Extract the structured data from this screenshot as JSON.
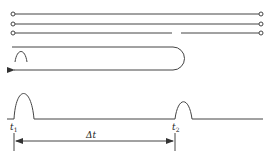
{
  "diagram": {
    "type": "signal-propagation-schematic",
    "colors": {
      "stroke": "#333333",
      "background": "#ffffff"
    },
    "cable": {
      "conductors": 3,
      "third_conductor_gap": true,
      "terminals": "open-circle-ends"
    },
    "reflection_loop": {
      "arrow_direction": "left",
      "pulse_shown": true
    },
    "timing": {
      "label_t1_base": "t",
      "label_t1_sub": "1",
      "label_t2_base": "t",
      "label_t2_sub": "2",
      "label_delta": "Δt"
    }
  }
}
